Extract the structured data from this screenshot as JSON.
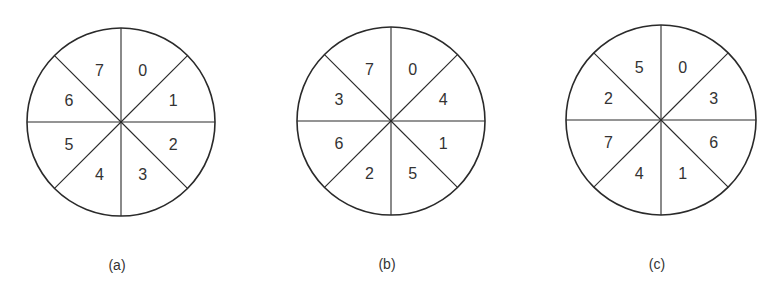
{
  "figure": {
    "sector_order_note": "sectors listed clockwise starting from the top-right sector (just right of 12 o'clock)",
    "diagrams": [
      {
        "id": "a",
        "caption": "(a)",
        "cx": 121,
        "cy": 122,
        "r": 94,
        "sectors": [
          "0",
          "1",
          "2",
          "3",
          "4",
          "5",
          "6",
          "7"
        ]
      },
      {
        "id": "b",
        "caption": "(b)",
        "cx": 391,
        "cy": 121,
        "r": 94,
        "sectors": [
          "0",
          "4",
          "1",
          "5",
          "2",
          "6",
          "3",
          "7"
        ]
      },
      {
        "id": "c",
        "caption": "(c)",
        "cx": 661,
        "cy": 120,
        "r": 95,
        "sectors": [
          "0",
          "3",
          "6",
          "1",
          "4",
          "7",
          "2",
          "5"
        ]
      }
    ],
    "colors": {
      "line": "#2a2a2a",
      "text": "#333333",
      "background": "#ffffff"
    }
  }
}
